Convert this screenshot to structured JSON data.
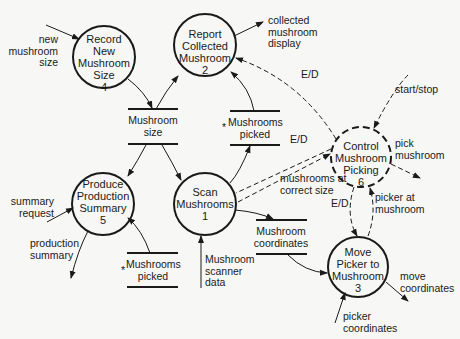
{
  "diagram": {
    "type": "data-flow-diagram",
    "processes": [
      {
        "id": "4",
        "name": "Record\nNew\nMushroom\nSize",
        "number": "4",
        "style": "solid"
      },
      {
        "id": "2",
        "name": "Report\nCollected\nMushroom",
        "number": "2",
        "style": "solid"
      },
      {
        "id": "6",
        "name": "Control\nMushroom\nPicking",
        "number": "6",
        "style": "dashed"
      },
      {
        "id": "5",
        "name": "Produce\nProduction\nSummary",
        "number": "5",
        "style": "solid"
      },
      {
        "id": "1",
        "name": "Scan\nMushrooms",
        "number": "1",
        "style": "solid"
      },
      {
        "id": "3",
        "name": "Move\nPicker to\nMushroom",
        "number": "3",
        "style": "solid"
      }
    ],
    "stores": [
      {
        "id": "mushroom-size",
        "label": "Mushroom\nsize",
        "marker": ""
      },
      {
        "id": "mushrooms-picked-top",
        "label": "Mushrooms\npicked",
        "marker": "*"
      },
      {
        "id": "mushrooms-picked-bottom",
        "label": "Mushrooms\npicked",
        "marker": "*"
      },
      {
        "id": "mushroom-coordinates",
        "label": "Mushroom\ncoordinates",
        "marker": ""
      }
    ],
    "flows": {
      "new_mushroom_size": "new\nmushroom\nsize",
      "collected_mushroom_display": "collected\nmushroom\ndisplay",
      "ed_2": "E/D",
      "start_stop": "start/stop",
      "ed_1": "E/D",
      "pick_mushroom": "pick\nmushroom",
      "summary_request": "summary\nrequest",
      "production_summary": "production\nsummary",
      "mushrooms_at_correct_size": "mushrooms at\ncorrect size",
      "ed_3": "E/D",
      "picker_at_mushroom": "picker at\nmushroom",
      "mushroom_scanner_data": "Mushroom\nscanner\ndata",
      "move_coordinates": "move\ncoordinates",
      "picker_coordinates": "picker\ncoordinates"
    }
  }
}
